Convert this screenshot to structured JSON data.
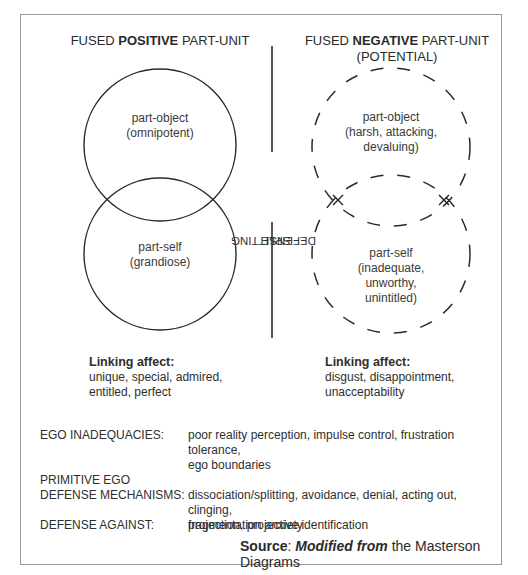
{
  "left_unit": {
    "heading_prefix": "FUSED ",
    "heading_bold": "POSITIVE",
    "heading_suffix": " PART-UNIT",
    "part_object": {
      "label": "part-object",
      "desc": "(omnipotent)"
    },
    "part_self": {
      "label": "part-self",
      "desc": "(grandiose)"
    },
    "circle_style": "solid",
    "linking_affect": {
      "title": "Linking affect:",
      "line1": "unique, special, admired,",
      "line2": "entitled, perfect"
    }
  },
  "divider": {
    "line1": "SPLITTING",
    "line2": "DEFENSE"
  },
  "right_unit": {
    "heading_prefix": "FUSED ",
    "heading_bold": "NEGATIVE",
    "heading_suffix": " PART-UNIT",
    "heading_line2": "(POTENTIAL)",
    "part_object": {
      "label": "part-object",
      "line1": "(harsh, attacking,",
      "line2": "devaluing)"
    },
    "part_self": {
      "label": "part-self",
      "line1": "(inadequate,",
      "line2": "unworthy,",
      "line3": "unintitled)"
    },
    "circle_style": "dashed",
    "markers": [
      "x-mark",
      "x-mark"
    ],
    "linking_affect": {
      "title": "Linking affect:",
      "line1": "disgust, disappointment,",
      "line2": "unacceptability"
    }
  },
  "ego_table": {
    "rows": [
      {
        "label": "EGO INADEQUACIES:",
        "value_line1": "poor reality perception, impulse control, frustration tolerance,",
        "value_line2": "ego boundaries"
      },
      {
        "label_line1": "PRIMITIVE EGO",
        "label_line2": "DEFENSE MECHANISMS:",
        "value_line1": "dissociation/splitting, avoidance, denial, acting out, clinging,",
        "value_line2": "projection, projective identification"
      },
      {
        "label": "DEFENSE AGAINST:",
        "value_line1": "fragmentation anxiety"
      }
    ]
  },
  "source": {
    "label": "Source",
    "colon": ": ",
    "emph": "Modified from",
    "rest": " the Masterson Diagrams"
  },
  "colors": {
    "stroke": "#2a2a2a",
    "frame": "#9a9a9a",
    "text": "#2e2e2e"
  }
}
